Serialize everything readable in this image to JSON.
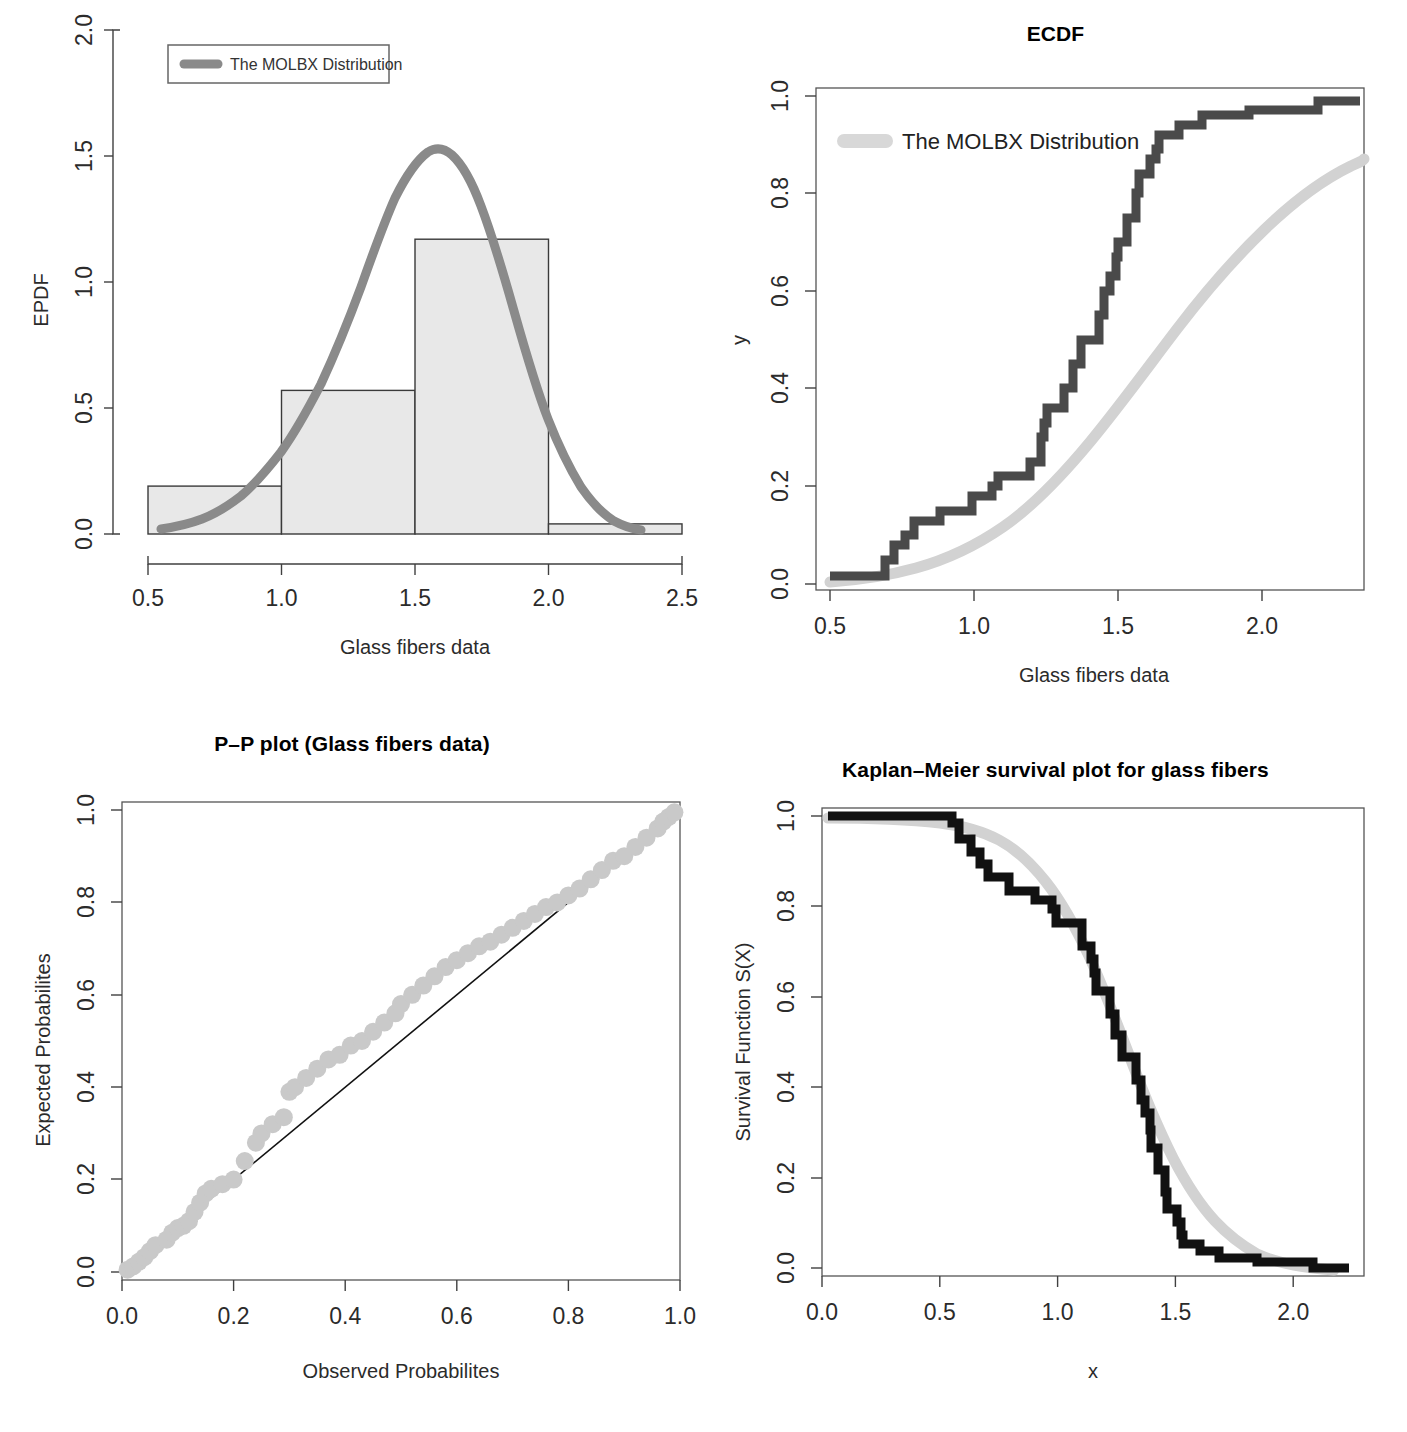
{
  "figure": {
    "kind": "four-panel-goodness-of-fit",
    "distribution_name": "The MOLBX Distribution"
  },
  "panels": {
    "epdf": {
      "title": "",
      "xlabel": "Glass fibers data",
      "ylabel": "EPDF",
      "legend_label": "The MOLBX Distribution"
    },
    "ecdf": {
      "title": "ECDF",
      "xlabel": "Glass fibers data",
      "ylabel": "y",
      "legend_label": "The MOLBX Distribution"
    },
    "pp": {
      "title": "P–P plot (Glass fibers data)",
      "xlabel": "Observed Probabilites",
      "ylabel": "Expected Probabilites"
    },
    "km": {
      "title": "Kaplan–Meier survival plot for glass fibers",
      "xlabel": "x",
      "ylabel": "Survival  Function S(X)"
    }
  },
  "colors": {
    "pdf_curve": "#8a8a8a",
    "fitted_curve": "#d2d2d2",
    "empirical_step": "#4a4a4a",
    "km_step": "#111111",
    "bar_fill": "#e8e8e8",
    "bar_border": "#3a3a3a",
    "pp_point": "#c9c9c9",
    "reference_line": "#111111",
    "axis": "#404040"
  },
  "chart_data": [
    {
      "type": "bar",
      "id": "epdf-histogram",
      "title": "",
      "xlabel": "Glass fibers data",
      "ylabel": "EPDF",
      "xlim": [
        0.5,
        2.5
      ],
      "ylim": [
        0.0,
        2.0
      ],
      "xticks": [
        "0.5",
        "1.0",
        "1.5",
        "2.0",
        "2.5"
      ],
      "yticks": [
        "0.0",
        "0.5",
        "1.0",
        "1.5",
        "2.0"
      ],
      "grid": false,
      "legend_position": "top-left",
      "bin_edges": [
        0.5,
        1.0,
        1.5,
        2.0,
        2.5
      ],
      "categories": [
        "0.5-1.0",
        "1.0-1.5",
        "1.5-2.0",
        "2.0-2.5"
      ],
      "values": [
        0.19,
        0.57,
        1.17,
        0.04
      ],
      "series": [
        {
          "name": "The MOLBX Distribution",
          "type": "line",
          "x": [
            0.55,
            0.65,
            0.75,
            0.85,
            0.95,
            1.05,
            1.15,
            1.25,
            1.35,
            1.45,
            1.5,
            1.55,
            1.6,
            1.65,
            1.7,
            1.75,
            1.85,
            1.95,
            2.05,
            2.15,
            2.25
          ],
          "values": [
            0.02,
            0.04,
            0.07,
            0.12,
            0.2,
            0.32,
            0.5,
            0.76,
            1.08,
            1.4,
            1.5,
            1.56,
            1.55,
            1.47,
            1.32,
            1.12,
            0.7,
            0.4,
            0.2,
            0.09,
            0.04
          ]
        }
      ]
    },
    {
      "type": "line",
      "id": "ecdf",
      "title": "ECDF",
      "xlabel": "Glass fibers data",
      "ylabel": "y",
      "xlim": [
        0.45,
        2.35
      ],
      "ylim": [
        0.0,
        1.0
      ],
      "xticks": [
        "0.5",
        "1.0",
        "1.5",
        "2.0"
      ],
      "yticks": [
        "0.0",
        "0.2",
        "0.4",
        "0.6",
        "0.8",
        "1.0"
      ],
      "grid": false,
      "legend_position": "top-left",
      "series": [
        {
          "name": "Empirical CDF",
          "style": "step",
          "x": [
            0.55,
            0.74,
            0.77,
            0.81,
            0.84,
            0.93,
            1.04,
            1.11,
            1.13,
            1.24,
            1.28,
            1.29,
            1.3,
            1.36,
            1.39,
            1.42,
            1.48,
            1.5,
            1.52,
            1.54,
            1.55,
            1.58,
            1.61,
            1.62,
            1.66,
            1.68,
            1.69,
            1.76,
            1.84,
            2.0,
            2.24
          ],
          "values": [
            0.016,
            0.05,
            0.08,
            0.1,
            0.13,
            0.15,
            0.18,
            0.2,
            0.22,
            0.25,
            0.3,
            0.33,
            0.36,
            0.4,
            0.45,
            0.5,
            0.55,
            0.6,
            0.63,
            0.67,
            0.7,
            0.75,
            0.8,
            0.84,
            0.87,
            0.9,
            0.92,
            0.95,
            0.97,
            0.99,
            1.0
          ]
        },
        {
          "name": "The MOLBX Distribution",
          "style": "smooth",
          "x": [
            0.5,
            0.6,
            0.7,
            0.8,
            0.9,
            1.0,
            1.1,
            1.2,
            1.3,
            1.4,
            1.5,
            1.6,
            1.7,
            1.8,
            1.9,
            2.0,
            2.1,
            2.2,
            2.3
          ],
          "values": [
            0.005,
            0.012,
            0.025,
            0.045,
            0.075,
            0.12,
            0.18,
            0.26,
            0.37,
            0.5,
            0.63,
            0.76,
            0.86,
            0.92,
            0.96,
            0.98,
            0.99,
            0.995,
            1.0
          ]
        }
      ]
    },
    {
      "type": "scatter",
      "id": "pp-plot",
      "title": "P–P plot (Glass fibers data)",
      "xlabel": "Observed Probabilites",
      "ylabel": "Expected Probabilites",
      "xlim": [
        0.0,
        1.0
      ],
      "ylim": [
        0.0,
        1.0
      ],
      "xticks": [
        "0.0",
        "0.2",
        "0.4",
        "0.6",
        "0.8",
        "1.0"
      ],
      "yticks": [
        "0.0",
        "0.2",
        "0.4",
        "0.6",
        "0.8",
        "1.0"
      ],
      "grid": false,
      "reference_line": "y = x",
      "x": [
        0.01,
        0.02,
        0.03,
        0.04,
        0.05,
        0.06,
        0.08,
        0.09,
        0.1,
        0.11,
        0.12,
        0.13,
        0.14,
        0.15,
        0.16,
        0.18,
        0.2,
        0.22,
        0.24,
        0.25,
        0.27,
        0.29,
        0.3,
        0.31,
        0.33,
        0.35,
        0.37,
        0.39,
        0.41,
        0.43,
        0.45,
        0.47,
        0.49,
        0.5,
        0.52,
        0.54,
        0.56,
        0.58,
        0.6,
        0.62,
        0.64,
        0.66,
        0.68,
        0.7,
        0.72,
        0.74,
        0.76,
        0.78,
        0.8,
        0.82,
        0.84,
        0.86,
        0.88,
        0.9,
        0.92,
        0.94,
        0.96,
        0.97,
        0.98,
        0.99
      ],
      "y": [
        0.005,
        0.012,
        0.022,
        0.032,
        0.045,
        0.058,
        0.07,
        0.085,
        0.095,
        0.1,
        0.11,
        0.13,
        0.15,
        0.17,
        0.18,
        0.19,
        0.2,
        0.24,
        0.28,
        0.3,
        0.32,
        0.335,
        0.39,
        0.4,
        0.42,
        0.44,
        0.46,
        0.47,
        0.49,
        0.5,
        0.52,
        0.54,
        0.56,
        0.58,
        0.6,
        0.62,
        0.64,
        0.66,
        0.675,
        0.69,
        0.705,
        0.715,
        0.73,
        0.745,
        0.76,
        0.775,
        0.79,
        0.8,
        0.815,
        0.83,
        0.85,
        0.87,
        0.89,
        0.9,
        0.92,
        0.94,
        0.96,
        0.975,
        0.985,
        0.995
      ]
    },
    {
      "type": "line",
      "id": "kaplan-meier",
      "title": "Kaplan–Meier survival plot for glass fibers",
      "xlabel": "x",
      "ylabel": "Survival  Function S(X)",
      "xlim": [
        0.0,
        2.3
      ],
      "ylim": [
        0.0,
        1.0
      ],
      "xticks": [
        "0.0",
        "0.5",
        "1.0",
        "1.5",
        "2.0"
      ],
      "yticks": [
        "0.0",
        "0.2",
        "0.4",
        "0.6",
        "0.8",
        "1.0"
      ],
      "grid": false,
      "series": [
        {
          "name": "Kaplan-Meier estimate",
          "style": "step",
          "x": [
            0.0,
            0.55,
            0.74,
            0.77,
            0.81,
            0.84,
            0.93,
            1.04,
            1.11,
            1.13,
            1.24,
            1.28,
            1.29,
            1.3,
            1.36,
            1.39,
            1.42,
            1.48,
            1.5,
            1.52,
            1.54,
            1.55,
            1.58,
            1.61,
            1.62,
            1.66,
            1.68,
            1.69,
            1.76,
            1.84,
            2.0,
            2.24,
            2.3
          ],
          "values": [
            1.0,
            0.984,
            0.95,
            0.92,
            0.9,
            0.87,
            0.85,
            0.82,
            0.8,
            0.78,
            0.75,
            0.7,
            0.67,
            0.64,
            0.6,
            0.55,
            0.5,
            0.45,
            0.4,
            0.37,
            0.33,
            0.3,
            0.25,
            0.2,
            0.16,
            0.13,
            0.1,
            0.08,
            0.05,
            0.03,
            0.02,
            0.01,
            0.0
          ]
        },
        {
          "name": "The MOLBX Distribution",
          "style": "smooth",
          "x": [
            0.0,
            0.2,
            0.4,
            0.6,
            0.8,
            1.0,
            1.1,
            1.2,
            1.3,
            1.4,
            1.5,
            1.6,
            1.7,
            1.8,
            1.9,
            2.0,
            2.1,
            2.2,
            2.3
          ],
          "values": [
            1.0,
            0.999,
            0.997,
            0.99,
            0.975,
            0.94,
            0.91,
            0.86,
            0.78,
            0.66,
            0.52,
            0.36,
            0.22,
            0.13,
            0.07,
            0.04,
            0.02,
            0.01,
            0.005
          ]
        }
      ]
    }
  ]
}
